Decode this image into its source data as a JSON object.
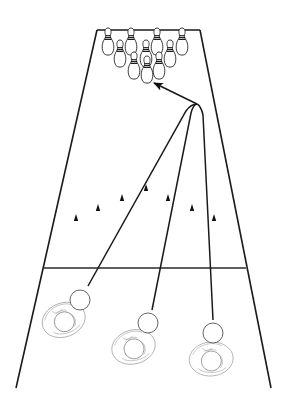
{
  "diagram": {
    "colors": {
      "line": "#1a1a1a",
      "background": "#ffffff",
      "bowler_outline": "#9a9a9a"
    },
    "lane": {
      "top_left": [
        97,
        30
      ],
      "top_right": [
        200,
        30
      ],
      "bottom_left": [
        16,
        388
      ],
      "bottom_right": [
        271,
        388
      ],
      "foul_line_y": 268
    },
    "pins": {
      "count": 10,
      "rows": [
        {
          "row": 4,
          "positions": [
            [
              108,
              38
            ],
            [
              131,
              38
            ],
            [
              157,
              38
            ],
            [
              182,
              38
            ]
          ]
        },
        {
          "row": 3,
          "positions": [
            [
              120,
              50
            ],
            [
              146,
              50
            ],
            [
              170,
              50
            ]
          ]
        },
        {
          "row": 2,
          "positions": [
            [
              134,
              62
            ],
            [
              159,
              62
            ]
          ]
        },
        {
          "row": 1,
          "positions": [
            [
              147,
              76
            ]
          ]
        }
      ]
    },
    "target_markers": {
      "count": 7,
      "positions": [
        [
          76,
          220
        ],
        [
          98,
          210
        ],
        [
          122,
          200
        ],
        [
          146,
          189
        ],
        [
          168,
          200
        ],
        [
          192,
          210
        ],
        [
          214,
          220
        ]
      ]
    },
    "convergence_point": [
      197,
      104
    ],
    "arrow_target": [
      153,
      82
    ],
    "bowlers": [
      {
        "id": "left",
        "ball": [
          79,
          298
        ],
        "body_center": [
          63,
          319
        ]
      },
      {
        "id": "center",
        "ball": [
          148,
          323
        ],
        "body_center": [
          133,
          347
        ]
      },
      {
        "id": "right",
        "ball": [
          213,
          332
        ],
        "body_center": [
          211,
          356
        ]
      }
    ]
  }
}
